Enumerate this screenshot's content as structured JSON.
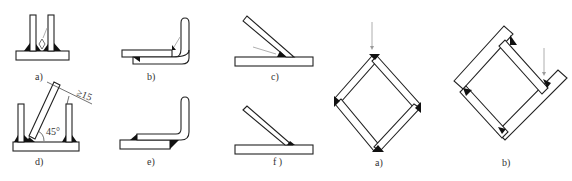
{
  "figure": {
    "left_group": {
      "panels": [
        {
          "id": "a",
          "label": "a)"
        },
        {
          "id": "b",
          "label": "b)"
        },
        {
          "id": "c",
          "label": "c)"
        },
        {
          "id": "d",
          "label": "d)",
          "angle_label": "45°",
          "dimension_label": "≥15"
        },
        {
          "id": "e",
          "label": "e)"
        },
        {
          "id": "f",
          "label": "f )"
        }
      ]
    },
    "right_group": {
      "panels": [
        {
          "id": "a2",
          "label": "a)"
        },
        {
          "id": "b2",
          "label": "b)"
        }
      ]
    },
    "colors": {
      "outline": "#222222",
      "weld_fill": "#111111",
      "arrow": "#9a9a9a",
      "background": "#ffffff"
    }
  }
}
